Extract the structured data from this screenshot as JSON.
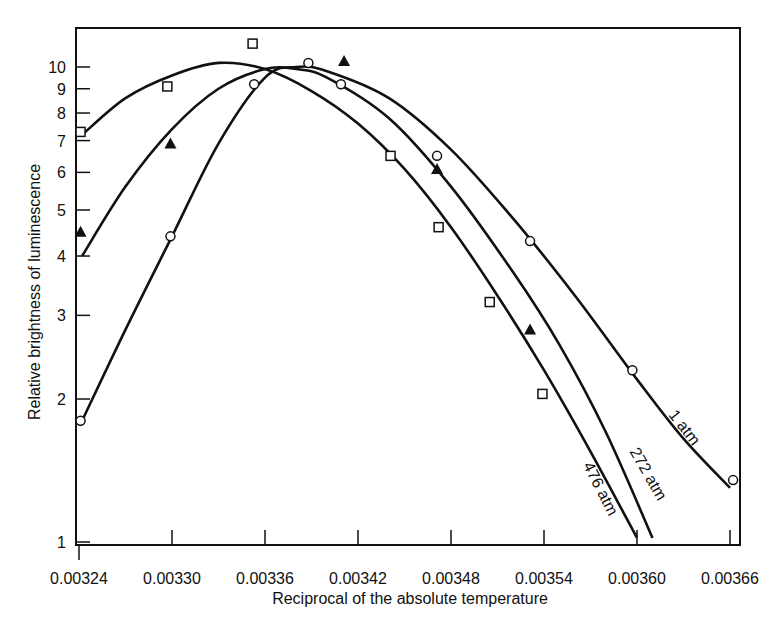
{
  "chart_data": {
    "type": "line",
    "title": "",
    "xlabel": "Reciprocal of the absolute temperature",
    "ylabel": "Relative brightness of luminescence",
    "xlim": [
      0.00324,
      0.00366
    ],
    "ylim": [
      1,
      12
    ],
    "yscale": "log",
    "grid": false,
    "legend": "inline curve labels",
    "x_ticks": [
      "0.00324",
      "0.00330",
      "0.00336",
      "0.00342",
      "0.00348",
      "0.00354",
      "0.00360",
      "0.00366"
    ],
    "y_ticks": [
      "1",
      "2",
      "3",
      "4",
      "5",
      "6",
      "7",
      "8",
      "9",
      "10"
    ],
    "series": [
      {
        "name": "1 atm",
        "marker": "circle-open",
        "points": [
          [
            0.003241,
            1.8
          ],
          [
            0.003299,
            4.4
          ],
          [
            0.003353,
            9.2
          ],
          [
            0.003388,
            10.2
          ],
          [
            0.003409,
            9.2
          ],
          [
            0.003471,
            6.5
          ],
          [
            0.003531,
            4.3
          ],
          [
            0.003597,
            2.3
          ],
          [
            0.003662,
            1.35
          ]
        ],
        "curve": [
          [
            0.003242,
            1.8
          ],
          [
            0.00327,
            2.8
          ],
          [
            0.0033,
            4.4
          ],
          [
            0.00333,
            6.9
          ],
          [
            0.00336,
            9.5
          ],
          [
            0.00338,
            10.0
          ],
          [
            0.0034,
            9.8
          ],
          [
            0.00344,
            8.6
          ],
          [
            0.00348,
            6.7
          ],
          [
            0.00352,
            4.8
          ],
          [
            0.00356,
            3.3
          ],
          [
            0.0036,
            2.2
          ],
          [
            0.00363,
            1.65
          ],
          [
            0.00366,
            1.3
          ]
        ]
      },
      {
        "name": "272 atm",
        "marker": "triangle-filled",
        "points": [
          [
            0.003241,
            4.5
          ],
          [
            0.003299,
            6.9
          ],
          [
            0.003411,
            10.3
          ],
          [
            0.003471,
            6.1
          ],
          [
            0.003531,
            2.8
          ]
        ],
        "curve": [
          [
            0.003242,
            4.0
          ],
          [
            0.00327,
            5.6
          ],
          [
            0.0033,
            7.4
          ],
          [
            0.00333,
            9.0
          ],
          [
            0.00336,
            9.9
          ],
          [
            0.00338,
            9.9
          ],
          [
            0.0034,
            9.5
          ],
          [
            0.00344,
            7.8
          ],
          [
            0.00348,
            5.6
          ],
          [
            0.00352,
            3.7
          ],
          [
            0.00355,
            2.6
          ],
          [
            0.00358,
            1.7
          ],
          [
            0.00361,
            1.02
          ]
        ]
      },
      {
        "name": "476 atm",
        "marker": "square-open",
        "points": [
          [
            0.003241,
            7.3
          ],
          [
            0.003297,
            9.1
          ],
          [
            0.003352,
            11.2
          ],
          [
            0.003441,
            6.5
          ],
          [
            0.003472,
            4.6
          ],
          [
            0.003505,
            3.2
          ],
          [
            0.003539,
            2.05
          ]
        ],
        "curve": [
          [
            0.003242,
            7.2
          ],
          [
            0.00327,
            8.6
          ],
          [
            0.0033,
            9.6
          ],
          [
            0.00333,
            10.2
          ],
          [
            0.00336,
            9.9
          ],
          [
            0.00339,
            8.9
          ],
          [
            0.00342,
            7.6
          ],
          [
            0.00345,
            6.1
          ],
          [
            0.00348,
            4.6
          ],
          [
            0.00351,
            3.3
          ],
          [
            0.00354,
            2.3
          ],
          [
            0.00357,
            1.55
          ],
          [
            0.0036,
            1.02
          ]
        ]
      }
    ],
    "annotations": [
      {
        "text": "1 atm",
        "x": 0.00362,
        "y": 1.85,
        "rotation": 52
      },
      {
        "text": "272 atm",
        "x": 0.003595,
        "y": 1.55,
        "rotation": 60
      },
      {
        "text": "476 atm",
        "x": 0.003565,
        "y": 1.45,
        "rotation": 63
      }
    ]
  }
}
